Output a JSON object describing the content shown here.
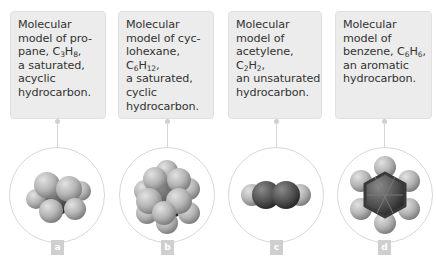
{
  "figure": {
    "panels": [
      {
        "id": "a",
        "label": "a",
        "caption_lines": [
          "Molecular",
          "model of pro-",
          "pane, C",
          "3",
          "H",
          "8",
          ",",
          "a saturated,",
          "acyclic",
          "hydrocarbon."
        ],
        "caption_text": "Molecular model of propane, C3H8, a saturated, acyclic hydrocarbon.",
        "molecule": "propane",
        "formula": {
          "c": "3",
          "h": "8"
        }
      },
      {
        "id": "b",
        "label": "b",
        "caption_text": "Molecular model of cyclohexane, C6H12, a saturated, cyclic hydrocarbon.",
        "molecule": "cyclohexane",
        "formula": {
          "c": "6",
          "h": "12"
        }
      },
      {
        "id": "c",
        "label": "c",
        "caption_text": "Molecular model of acetylene, C2H2, an unsaturated hydrocarbon.",
        "molecule": "acetylene",
        "formula": {
          "c": "2",
          "h": "2"
        }
      },
      {
        "id": "d",
        "label": "d",
        "caption_text": "Molecular model of benzene, C6H6, an aromatic hydrocarbon.",
        "molecule": "benzene",
        "formula": {
          "c": "6",
          "h": "6"
        }
      }
    ],
    "text": {
      "a": {
        "l1": "Molecular",
        "l2": "model of pro-",
        "l3a": "pane, C",
        "l3b": "H",
        "l3c": ",",
        "l4": "a saturated,",
        "l5": "acyclic",
        "l6": "hydrocarbon."
      },
      "b": {
        "l1": "Molecular",
        "l2": "model of cyc-",
        "l3": "lohexane,",
        "l4a": "C",
        "l4b": "H",
        "l4c": ",",
        "l5": "a saturated,",
        "l6": "cyclic",
        "l7": "hydrocarbon."
      },
      "c": {
        "l1": "Molecular",
        "l2": "model of",
        "l3": "acetylene,",
        "l4a": "C",
        "l4b": "H",
        "l4c": ",",
        "l5": "an unsaturated",
        "l6": "hydrocarbon."
      },
      "d": {
        "l1": "Molecular",
        "l2": "model of",
        "l3a": "benzene, C",
        "l3b": "H",
        "l3c": ",",
        "l4": "an aromatic",
        "l5": "hydrocarbon."
      }
    },
    "colors": {
      "box_bg": "#ececec",
      "connector": "#d6d6d6",
      "ring": "#d8d8d8",
      "badge_bg": "#cfcfcf",
      "carbon": "#5a5a5a",
      "hydrogen": "#b8b8b8"
    }
  }
}
